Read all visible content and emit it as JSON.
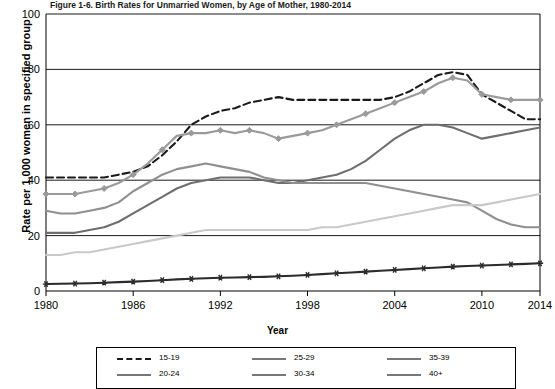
{
  "figure": {
    "title": "Figure 1-6. Birth Rates for Unmarried Women, by Age of Mother, 1980-2014",
    "xlabel": "Year",
    "ylabel": "Rate per 1,000 women in specified group"
  },
  "legend": {
    "items": [
      {
        "label": "15-19",
        "marker": "dashed-line"
      },
      {
        "label": "20-24",
        "marker": "diamond-line"
      },
      {
        "label": "25-29",
        "marker": "solid-line"
      },
      {
        "label": "30-34",
        "marker": "solid-line"
      },
      {
        "label": "35-39",
        "marker": "solid-line"
      },
      {
        "label": "40+",
        "marker": "star-line"
      }
    ]
  },
  "chart_data": {
    "type": "line",
    "title": "Figure 1-6. Birth Rates for Unmarried Women, by Age of Mother, 1980-2014",
    "xlabel": "Year",
    "ylabel": "Rate per 1,000 women in specified group",
    "xlim": [
      1980,
      2014
    ],
    "ylim": [
      0,
      100
    ],
    "yticks": [
      0,
      20,
      40,
      60,
      80,
      100
    ],
    "xticks": [
      1980,
      1986,
      1992,
      1998,
      2004,
      2010,
      2014
    ],
    "grid": "horizontal",
    "legend_position": "below-plot",
    "x": [
      1980,
      1981,
      1982,
      1983,
      1984,
      1985,
      1986,
      1987,
      1988,
      1989,
      1990,
      1991,
      1992,
      1993,
      1994,
      1995,
      1996,
      1997,
      1998,
      1999,
      2000,
      2001,
      2002,
      2003,
      2004,
      2005,
      2006,
      2007,
      2008,
      2009,
      2010,
      2011,
      2012,
      2013,
      2014
    ],
    "series": [
      {
        "name": "15-19",
        "color": "#1a1a1a",
        "style": "dashed",
        "values": [
          41,
          41,
          41,
          41,
          41,
          42,
          43,
          45,
          49,
          54,
          60,
          63,
          65,
          66,
          68,
          69,
          70,
          69,
          69,
          69,
          69,
          69,
          69,
          69,
          70,
          72,
          75,
          78,
          79,
          78,
          71,
          68,
          65,
          62,
          62
        ]
      },
      {
        "name": "20-24",
        "color": "#9a9a9a",
        "style": "solid-diamond",
        "values": [
          35,
          35,
          35,
          36,
          37,
          39,
          42,
          46,
          51,
          56,
          57,
          57,
          58,
          57,
          58,
          57,
          55,
          56,
          57,
          58,
          60,
          62,
          64,
          66,
          68,
          70,
          72,
          75,
          77,
          76,
          71,
          70,
          69,
          69,
          69
        ]
      },
      {
        "name": "25-29",
        "color": "#6e6e6e",
        "style": "solid",
        "values": [
          21,
          21,
          21,
          22,
          23,
          25,
          28,
          31,
          34,
          37,
          39,
          40,
          41,
          41,
          41,
          40,
          39,
          39,
          40,
          41,
          42,
          44,
          47,
          51,
          55,
          58,
          60,
          60,
          59,
          57,
          55,
          56,
          57,
          58,
          59
        ]
      },
      {
        "name": "30-34",
        "color": "#8f8f8f",
        "style": "solid",
        "values": [
          29,
          28,
          28,
          29,
          30,
          32,
          36,
          39,
          42,
          44,
          45,
          46,
          45,
          44,
          43,
          41,
          40,
          39,
          39,
          39,
          39,
          39,
          39,
          38,
          37,
          36,
          35,
          34,
          33,
          32,
          29,
          26,
          24,
          23,
          23
        ]
      },
      {
        "name": "35-39",
        "color": "#c9c9c9",
        "style": "solid",
        "values": [
          13,
          13,
          14,
          14,
          15,
          16,
          17,
          18,
          19,
          20,
          21,
          22,
          22,
          22,
          22,
          22,
          22,
          22,
          22,
          23,
          23,
          24,
          25,
          26,
          27,
          28,
          29,
          30,
          31,
          31,
          31,
          32,
          33,
          34,
          35
        ]
      },
      {
        "name": "40+",
        "color": "#2b2b2b",
        "style": "solid-star",
        "values": [
          2.5,
          2.6,
          2.7,
          2.8,
          3.0,
          3.2,
          3.4,
          3.6,
          3.9,
          4.2,
          4.4,
          4.6,
          4.8,
          4.9,
          5.0,
          5.1,
          5.3,
          5.5,
          5.8,
          6.1,
          6.4,
          6.7,
          7.0,
          7.3,
          7.6,
          7.9,
          8.2,
          8.5,
          8.8,
          9.0,
          9.2,
          9.4,
          9.6,
          9.8,
          10.0
        ]
      }
    ]
  }
}
